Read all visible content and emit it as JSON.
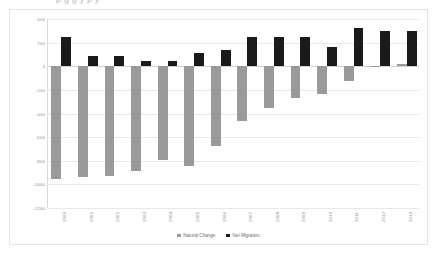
{
  "top_clipped_text": "p    g   g    y                p    y",
  "chart_data": {
    "type": "bar",
    "title": "",
    "xlabel": "",
    "ylabel": "",
    "categories": [
      "2000",
      "2001",
      "2002",
      "2003",
      "2004",
      "2005",
      "2006",
      "2007",
      "2008",
      "2009",
      "2010",
      "2011",
      "2012",
      "2013"
    ],
    "series": [
      {
        "name": "Natural Change",
        "color": "#9a9a9a",
        "values": [
          -955,
          -935,
          -925,
          -890,
          -795,
          -845,
          -675,
          -465,
          -355,
          -265,
          -232,
          -125,
          -5,
          22
        ]
      },
      {
        "name": "Net Migration",
        "color": "#1a1a1a",
        "values": [
          245,
          85,
          90,
          47,
          45,
          110,
          135,
          245,
          248,
          250,
          165,
          320,
          297,
          297
        ]
      }
    ],
    "ylim": [
      -1200,
      400
    ],
    "yticks": [
      400,
      200,
      0,
      -200,
      -400,
      -600,
      -800,
      -1000,
      -1200
    ],
    "ytick_labels": [
      "400",
      "200",
      "0",
      "-200",
      "-400",
      "-600",
      "-800",
      "-1000",
      "-1200"
    ],
    "grid": true,
    "legend_position": "bottom",
    "bar_mode": "grouped"
  },
  "legend": {
    "items": [
      {
        "label": "Natural Change",
        "color": "#9a9a9a"
      },
      {
        "label": "Net Migration",
        "color": "#1a1a1a"
      }
    ]
  },
  "colors": {
    "natural_change": "#9a9a9a",
    "net_migration": "#1a1a1a",
    "gridline": "#e8e8e8",
    "axis_text": "#8d8d8d",
    "frame_border": "#e3e3e3"
  }
}
